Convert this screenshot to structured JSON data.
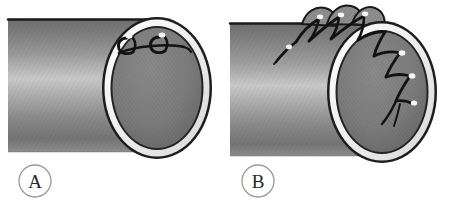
{
  "figure": {
    "type": "medical-illustration",
    "background_color": "#ffffff",
    "panel_count": 2
  },
  "panels": [
    {
      "id": "A",
      "label": "A",
      "label_shape": "circle",
      "depicts": "cylindrical tube seen end-on with two interrupted suture loops placed at the top of the lumen rim",
      "suture_style": "interrupted",
      "suture_count": 2,
      "suture_location": "inside lumen at superior rim",
      "knot_highlight_count": 2
    },
    {
      "id": "B",
      "label": "B",
      "label_shape": "circle",
      "depicts": "cylindrical tube seen end-on with a continuous running suture passing over the outer wall and descending diagonally across the lumen",
      "suture_style": "continuous-running",
      "suture_count": 6,
      "suture_location": "over outer wall and into lumen",
      "knot_highlight_count": 5,
      "tissue_gathering": "raised bites above tube edge"
    }
  ],
  "colors": {
    "background": "#ffffff",
    "tube_dark": "#6e6e6e",
    "tube_mid": "#8f8f8f",
    "tube_highlight": "#c9c9c9",
    "tube_shadow": "#5a5a5a",
    "tube_outline": "#1a1a1a",
    "rim_white": "#f2f2f2",
    "lumen_fill": "#7d7d7d",
    "lumen_shadow": "#606060",
    "suture_thread": "#121212",
    "knot_highlight": "#f5f5f5",
    "label_stroke": "#9a9a9a",
    "label_text": "#2b2b2b"
  },
  "geometry": {
    "panel_a": {
      "tube_top_y": 19,
      "tube_bottom_y": 152,
      "lumen_cx": 157,
      "lumen_cy": 88,
      "lumen_rx": 52,
      "lumen_ry": 68
    },
    "panel_b": {
      "tube_top_y": 23,
      "tube_bottom_y": 156,
      "lumen_cx": 382,
      "lumen_cy": 92,
      "lumen_rx": 52,
      "lumen_ry": 68
    }
  },
  "labels": {
    "a": {
      "text": "A",
      "cx": 35,
      "cy": 181,
      "r": 16
    },
    "b": {
      "text": "B",
      "cx": 258,
      "cy": 181,
      "r": 16
    }
  }
}
